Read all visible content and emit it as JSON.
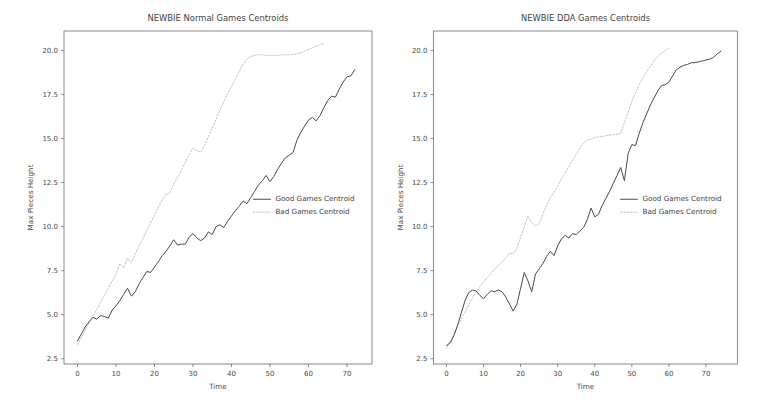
{
  "figure": {
    "width": 765,
    "height": 414,
    "background": "#ffffff",
    "panel_count": 2
  },
  "colors": {
    "good_series": "#4a4a4a",
    "bad_series": "#c2c2c2",
    "axis": "#6f6f6f",
    "text": "#3f3f3f",
    "background": "#ffffff"
  },
  "chart_data": [
    {
      "type": "line",
      "panel": "left",
      "title": "NEWBIE Normal Games Centroids",
      "xlabel": "Time",
      "ylabel": "Max Pieces Height",
      "xlim": [
        -3.5,
        76.5
      ],
      "ylim": [
        2.2,
        21.1
      ],
      "xticks": [
        0,
        10,
        20,
        30,
        40,
        50,
        60,
        70
      ],
      "xticklabels": [
        "0",
        "10",
        "20",
        "30",
        "40",
        "50",
        "60",
        "70"
      ],
      "yticks": [
        2.5,
        5.0,
        7.5,
        10.0,
        12.5,
        15.0,
        17.5,
        20.0
      ],
      "yticklabels": [
        "2.5",
        "5.0",
        "7.5",
        "10.0",
        "12.5",
        "15.0",
        "17.5",
        "20.0"
      ],
      "grid": false,
      "legend_position": "center-right",
      "series": [
        {
          "name": "Good Games Centroid",
          "style": "solid",
          "color": "#4a4a4a",
          "x": [
            0,
            1,
            2,
            3,
            4,
            5,
            6,
            7,
            8,
            9,
            10,
            11,
            12,
            13,
            14,
            15,
            16,
            17,
            18,
            19,
            20,
            21,
            22,
            23,
            24,
            25,
            26,
            27,
            28,
            29,
            30,
            31,
            32,
            33,
            34,
            35,
            36,
            37,
            38,
            39,
            40,
            41,
            42,
            43,
            44,
            45,
            46,
            47,
            48,
            49,
            50,
            51,
            52,
            53,
            54,
            55,
            56,
            57,
            58,
            59,
            60,
            61,
            62,
            63,
            64,
            65,
            66,
            67,
            68,
            69,
            70,
            71,
            72
          ],
          "values": [
            3.5,
            3.9,
            4.3,
            4.6,
            4.85,
            4.75,
            4.95,
            4.9,
            4.8,
            5.25,
            5.5,
            5.8,
            6.15,
            6.5,
            6.05,
            6.3,
            6.75,
            7.1,
            7.45,
            7.4,
            7.7,
            8.0,
            8.35,
            8.6,
            8.9,
            9.25,
            8.95,
            9.0,
            9.0,
            9.4,
            9.6,
            9.35,
            9.2,
            9.35,
            9.7,
            9.55,
            10.0,
            10.1,
            9.95,
            10.3,
            10.6,
            10.9,
            11.15,
            11.45,
            11.3,
            11.65,
            12.0,
            12.35,
            12.6,
            12.9,
            12.55,
            12.85,
            13.25,
            13.6,
            13.9,
            14.05,
            14.2,
            14.9,
            15.35,
            15.7,
            16.05,
            16.2,
            16.0,
            16.3,
            16.75,
            17.15,
            17.4,
            17.35,
            17.8,
            18.2,
            18.5,
            18.55,
            18.9,
            19.25,
            19.5,
            19.45,
            19.8,
            20.1,
            20.35,
            20.3,
            20.4
          ]
        },
        {
          "name": "Bad Games Centroid",
          "style": "dotted",
          "color": "#c2c2c2",
          "x": [
            0,
            1,
            2,
            3,
            4,
            5,
            6,
            7,
            8,
            9,
            10,
            11,
            12,
            13,
            14,
            15,
            16,
            17,
            18,
            19,
            20,
            21,
            22,
            23,
            24,
            25,
            26,
            27,
            28,
            29,
            30,
            31,
            32,
            33,
            34,
            35,
            36,
            37,
            38,
            39,
            40,
            41,
            42,
            43,
            44,
            45,
            46,
            47,
            48,
            49,
            50,
            51,
            52,
            53,
            54,
            55,
            56,
            57,
            58,
            59,
            60,
            61,
            62,
            63,
            64
          ],
          "values": [
            3.3,
            3.7,
            4.1,
            4.5,
            4.9,
            5.3,
            5.7,
            6.1,
            6.5,
            6.9,
            7.3,
            7.9,
            7.65,
            8.2,
            7.95,
            8.45,
            8.9,
            9.3,
            9.75,
            10.2,
            10.65,
            11.1,
            11.5,
            11.85,
            11.9,
            12.4,
            12.8,
            13.2,
            13.65,
            14.1,
            14.45,
            14.3,
            14.25,
            14.6,
            15.1,
            15.6,
            16.1,
            16.6,
            17.1,
            17.55,
            17.95,
            18.35,
            18.8,
            19.2,
            19.5,
            19.65,
            19.72,
            19.75,
            19.75,
            19.72,
            19.7,
            19.7,
            19.72,
            19.75,
            19.75,
            19.75,
            19.78,
            19.8,
            19.85,
            19.95,
            20.05,
            20.15,
            20.25,
            20.32,
            20.38
          ]
        }
      ]
    },
    {
      "type": "line",
      "panel": "right",
      "title": "NEWBIE DDA Games Centroids",
      "xlabel": "Time",
      "ylabel": "Max Pieces Height",
      "xlim": [
        -3.5,
        78.5
      ],
      "ylim": [
        2.2,
        21.1
      ],
      "xticks": [
        0,
        10,
        20,
        30,
        40,
        50,
        60,
        70
      ],
      "xticklabels": [
        "0",
        "10",
        "20",
        "30",
        "40",
        "50",
        "60",
        "70"
      ],
      "yticks": [
        2.5,
        5.0,
        7.5,
        10.0,
        12.5,
        15.0,
        17.5,
        20.0
      ],
      "yticklabels": [
        "2.5",
        "5.0",
        "7.5",
        "10.0",
        "12.5",
        "15.0",
        "17.5",
        "20.0"
      ],
      "grid": false,
      "legend_position": "center-right",
      "series": [
        {
          "name": "Good Games Centroid",
          "style": "solid",
          "color": "#4a4a4a",
          "x": [
            0,
            1,
            2,
            3,
            4,
            5,
            6,
            7,
            8,
            9,
            10,
            11,
            12,
            13,
            14,
            15,
            16,
            17,
            18,
            19,
            20,
            21,
            22,
            23,
            24,
            25,
            26,
            27,
            28,
            29,
            30,
            31,
            32,
            33,
            34,
            35,
            36,
            37,
            38,
            39,
            40,
            41,
            42,
            43,
            44,
            45,
            46,
            47,
            48,
            49,
            50,
            51,
            52,
            53,
            54,
            55,
            56,
            57,
            58,
            59,
            60,
            61,
            62,
            63,
            64,
            65,
            66,
            67,
            68,
            69,
            70,
            71,
            72,
            73,
            74
          ],
          "values": [
            3.25,
            3.4,
            3.8,
            4.4,
            5.1,
            5.8,
            6.25,
            6.4,
            6.35,
            6.1,
            5.9,
            6.15,
            6.35,
            6.3,
            6.4,
            6.3,
            6.0,
            5.6,
            5.2,
            5.6,
            6.5,
            7.4,
            6.9,
            6.3,
            7.3,
            7.6,
            7.9,
            8.3,
            8.6,
            8.35,
            8.9,
            9.3,
            9.5,
            9.35,
            9.6,
            9.55,
            9.75,
            9.95,
            10.4,
            11.05,
            10.55,
            10.7,
            11.2,
            11.6,
            12.0,
            12.45,
            12.9,
            13.35,
            12.6,
            14.15,
            14.65,
            14.6,
            15.3,
            15.9,
            16.4,
            16.9,
            17.3,
            17.7,
            18.0,
            18.05,
            18.2,
            18.55,
            18.9,
            19.05,
            19.15,
            19.2,
            19.3,
            19.3,
            19.35,
            19.4,
            19.45,
            19.5,
            19.6,
            19.8,
            19.95
          ]
        },
        {
          "name": "Bad Games Centroid",
          "style": "dotted",
          "color": "#c2c2c2",
          "x": [
            0,
            1,
            2,
            3,
            4,
            5,
            6,
            7,
            8,
            9,
            10,
            11,
            12,
            13,
            14,
            15,
            16,
            17,
            18,
            19,
            20,
            21,
            22,
            23,
            24,
            25,
            26,
            27,
            28,
            29,
            30,
            31,
            32,
            33,
            34,
            35,
            36,
            37,
            38,
            39,
            40,
            41,
            42,
            43,
            44,
            45,
            46,
            47,
            48,
            49,
            50,
            51,
            52,
            53,
            54,
            55,
            56,
            57,
            58,
            59,
            60
          ],
          "values": [
            3.1,
            3.5,
            3.9,
            4.35,
            4.75,
            5.15,
            5.55,
            5.95,
            6.3,
            6.6,
            6.85,
            7.1,
            7.35,
            7.6,
            7.8,
            8.0,
            8.2,
            8.5,
            8.45,
            8.75,
            9.4,
            10.0,
            10.6,
            10.2,
            10.05,
            10.15,
            10.7,
            11.2,
            11.65,
            11.95,
            12.3,
            12.7,
            13.05,
            13.4,
            13.75,
            14.1,
            14.45,
            14.75,
            14.9,
            14.95,
            15.05,
            15.1,
            15.1,
            15.15,
            15.2,
            15.2,
            15.25,
            15.3,
            15.9,
            16.5,
            17.1,
            17.6,
            18.05,
            18.45,
            18.8,
            19.1,
            19.4,
            19.65,
            19.85,
            20.0,
            20.15
          ]
        }
      ]
    }
  ]
}
